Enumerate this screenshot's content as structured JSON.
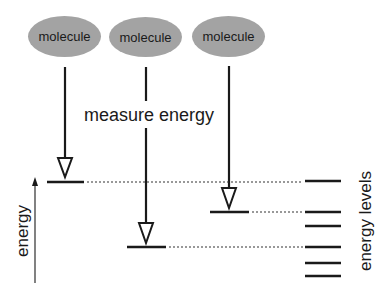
{
  "diagram": {
    "molecules": [
      {
        "label": "molecule",
        "cx": 64.5,
        "cy": 36.5,
        "rx": 36.5,
        "ry": 20.5
      },
      {
        "label": "molecule",
        "cx": 145.5,
        "cy": 37,
        "rx": 36.5,
        "ry": 20
      },
      {
        "label": "molecule",
        "cx": 228.5,
        "cy": 36.5,
        "rx": 36.5,
        "ry": 20.5
      }
    ],
    "measure_label": "measure energy",
    "axis_label": "energy",
    "levels_label": "energy levels",
    "colors": {
      "molecule_fill": "#a3a3a3",
      "line": "#1a1a1a",
      "background": "#ffffff"
    },
    "measurements": [
      {
        "molecule_index": 0,
        "x": 65,
        "measured_level_y": 182
      },
      {
        "molecule_index": 1,
        "x": 146,
        "measured_level_y": 247
      },
      {
        "molecule_index": 2,
        "x": 229,
        "measured_level_y": 212
      }
    ],
    "energy_levels_y": [
      181,
      212,
      226,
      247,
      263,
      276
    ]
  }
}
